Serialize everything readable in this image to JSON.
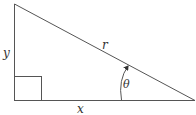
{
  "diagram": {
    "labels": {
      "vertical_side": "y",
      "horizontal_side": "x",
      "hypotenuse": "r",
      "angle": "θ"
    },
    "colors": {
      "line": "#555555",
      "text": "#333333",
      "background": "#ffffff"
    },
    "vertices": {
      "top": [
        14,
        4
      ],
      "right_angle": [
        14,
        100
      ],
      "right": [
        195,
        100
      ]
    },
    "right_angle_marker": {
      "x": 14,
      "y": 76,
      "width": 27,
      "height": 24
    }
  }
}
